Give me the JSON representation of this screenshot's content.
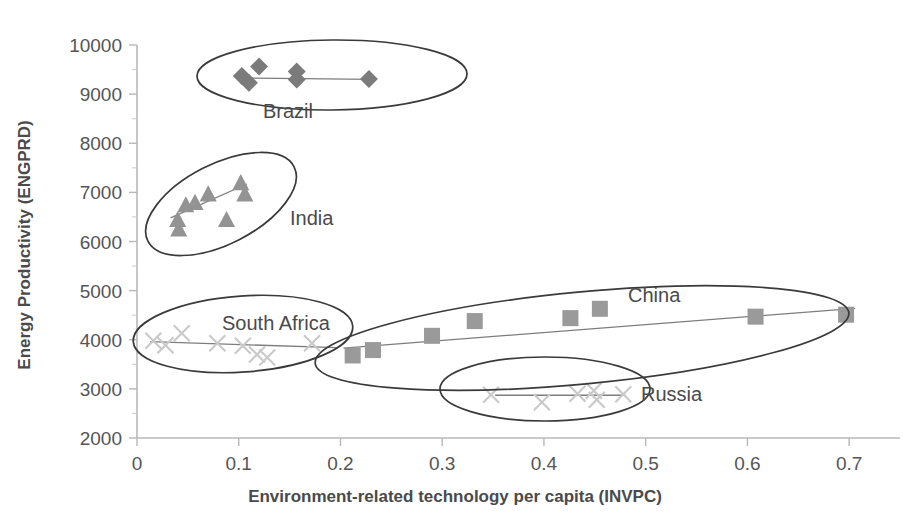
{
  "chart_data": {
    "type": "scatter",
    "title": "",
    "xlabel": "Environment-related technology per capita (INVPC)",
    "ylabel": "Energy Productivity (ENGPRD)",
    "xlim": [
      0,
      0.75
    ],
    "ylim": [
      2000,
      10000
    ],
    "xticks": [
      "0",
      "0.1",
      "0.2",
      "0.3",
      "0.4",
      "0.5",
      "0.6",
      "0.7"
    ],
    "xtick_values": [
      0,
      0.1,
      0.2,
      0.3,
      0.4,
      0.5,
      0.6,
      0.7
    ],
    "yticks": [
      "2000",
      "3000",
      "4000",
      "5000",
      "6000",
      "7000",
      "8000",
      "9000",
      "10000"
    ],
    "ytick_values": [
      2000,
      3000,
      4000,
      5000,
      6000,
      7000,
      8000,
      9000,
      10000
    ],
    "grid": false,
    "legend": "annotated clusters (no legend box)",
    "annotations": [
      "Brazil",
      "India",
      "South Africa",
      "China",
      "Russia"
    ],
    "series": [
      {
        "name": "Brazil",
        "marker": "diamond",
        "color": "#7b7b7b",
        "points": [
          {
            "x": 0.103,
            "y": 9370
          },
          {
            "x": 0.11,
            "y": 9230
          },
          {
            "x": 0.12,
            "y": 9560
          },
          {
            "x": 0.157,
            "y": 9460
          },
          {
            "x": 0.157,
            "y": 9300
          },
          {
            "x": 0.228,
            "y": 9310
          }
        ],
        "trend": [
          {
            "x": 0.1,
            "y": 9330
          },
          {
            "x": 0.232,
            "y": 9300
          }
        ]
      },
      {
        "name": "India",
        "marker": "triangle",
        "color": "#939393",
        "points": [
          {
            "x": 0.04,
            "y": 6440
          },
          {
            "x": 0.041,
            "y": 6250
          },
          {
            "x": 0.048,
            "y": 6740
          },
          {
            "x": 0.057,
            "y": 6790
          },
          {
            "x": 0.07,
            "y": 6960
          },
          {
            "x": 0.088,
            "y": 6440
          },
          {
            "x": 0.102,
            "y": 7190
          },
          {
            "x": 0.106,
            "y": 6960
          }
        ],
        "trend": [
          {
            "x": 0.033,
            "y": 6480
          },
          {
            "x": 0.108,
            "y": 7170
          }
        ]
      },
      {
        "name": "South Africa",
        "marker": "x",
        "color": "#c9c9c9",
        "points": [
          {
            "x": 0.016,
            "y": 3980
          },
          {
            "x": 0.028,
            "y": 3890
          },
          {
            "x": 0.044,
            "y": 4130
          },
          {
            "x": 0.079,
            "y": 3930
          },
          {
            "x": 0.104,
            "y": 3880
          },
          {
            "x": 0.118,
            "y": 3700
          },
          {
            "x": 0.128,
            "y": 3640
          },
          {
            "x": 0.172,
            "y": 3930
          }
        ],
        "trend": [
          {
            "x": 0.013,
            "y": 3960
          },
          {
            "x": 0.196,
            "y": 3840
          }
        ]
      },
      {
        "name": "China",
        "marker": "square",
        "color": "#9a9a9a",
        "points": [
          {
            "x": 0.212,
            "y": 3680
          },
          {
            "x": 0.232,
            "y": 3790
          },
          {
            "x": 0.29,
            "y": 4080
          },
          {
            "x": 0.332,
            "y": 4380
          },
          {
            "x": 0.426,
            "y": 4440
          },
          {
            "x": 0.455,
            "y": 4630
          },
          {
            "x": 0.608,
            "y": 4470
          },
          {
            "x": 0.697,
            "y": 4510
          }
        ],
        "trend": [
          {
            "x": 0.203,
            "y": 3830
          },
          {
            "x": 0.706,
            "y": 4640
          }
        ]
      },
      {
        "name": "Russia",
        "marker": "x",
        "color": "#c9c9c9",
        "points": [
          {
            "x": 0.348,
            "y": 2880
          },
          {
            "x": 0.398,
            "y": 2730
          },
          {
            "x": 0.433,
            "y": 2900
          },
          {
            "x": 0.449,
            "y": 2960
          },
          {
            "x": 0.452,
            "y": 2780
          },
          {
            "x": 0.478,
            "y": 2890
          }
        ],
        "trend": [
          {
            "x": 0.352,
            "y": 2870
          },
          {
            "x": 0.48,
            "y": 2870
          }
        ]
      }
    ]
  },
  "axis": {
    "x_title": "Environment-related technology per capita (INVPC)",
    "y_title": "Energy Productivity (ENGPRD)",
    "x_tick_labels": [
      "0",
      "0.1",
      "0.2",
      "0.3",
      "0.4",
      "0.5",
      "0.6",
      "0.7"
    ],
    "y_tick_labels": [
      "10000",
      "9000",
      "8000",
      "7000",
      "6000",
      "5000",
      "4000",
      "3000",
      "2000"
    ]
  },
  "cluster_labels": {
    "brazil": "Brazil",
    "india": "India",
    "south_africa": "South Africa",
    "china": "China",
    "russia": "Russia"
  },
  "colors": {
    "axis": "#b8b8b8",
    "text": "#4a4a4a",
    "ellipse": "#3a3a3a",
    "trend": "#7d7d7d",
    "diamond": "#7b7b7b",
    "triangle": "#939393",
    "square": "#9a9a9a",
    "cross": "#c9c9c9"
  }
}
